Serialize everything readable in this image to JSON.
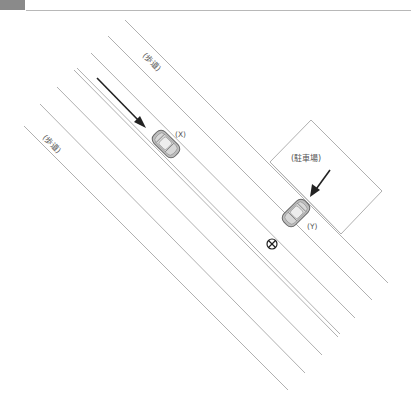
{
  "header": {
    "tab_color": "#8a8a8a",
    "rule_color": "#b8b8b8"
  },
  "diagram": {
    "labels": {
      "sidewalk_upper": "(歩道)",
      "sidewalk_lower": "(歩道)",
      "car_x": "(X)",
      "car_y": "(Y)",
      "parking_lot": "(駐車場)"
    },
    "symbols": {
      "collision_point": "⊗"
    },
    "colors": {
      "road_line": "#b0b0b0",
      "arrow": "#222222",
      "car_body": "#bdbdbd",
      "car_outline": "#666666"
    }
  }
}
